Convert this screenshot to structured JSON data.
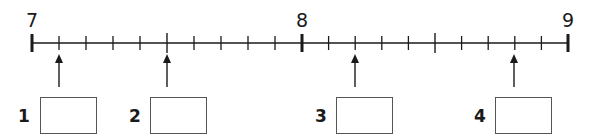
{
  "number_line": {
    "start": 7,
    "end": 9,
    "labels": [
      {
        "value": "7",
        "x": 32
      },
      {
        "value": "8",
        "x": 302
      },
      {
        "value": "9",
        "x": 568
      }
    ],
    "minor_step": 0.1,
    "axis_y": 43,
    "line_color": "#1a1a1a"
  },
  "questions": [
    {
      "label": "1",
      "arrow_x": 59,
      "label_x": 24,
      "box_x": 40,
      "value_shown": ""
    },
    {
      "label": "2",
      "arrow_x": 167,
      "label_x": 135,
      "box_x": 150,
      "value_shown": ""
    },
    {
      "label": "3",
      "arrow_x": 355,
      "label_x": 321,
      "box_x": 336,
      "value_shown": ""
    },
    {
      "label": "4",
      "arrow_x": 514,
      "label_x": 480,
      "box_x": 495,
      "value_shown": ""
    }
  ]
}
